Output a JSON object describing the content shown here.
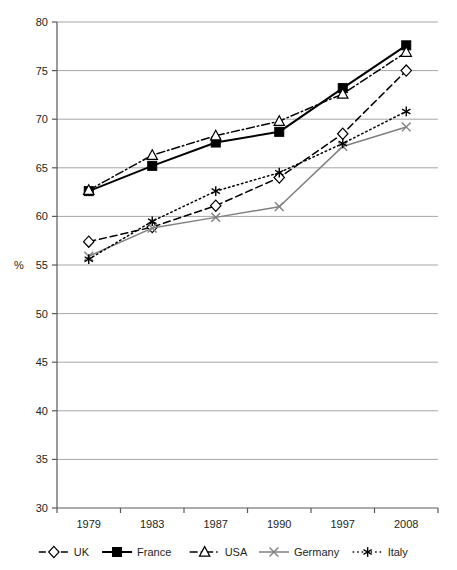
{
  "chart_data": {
    "type": "line",
    "title": "",
    "xlabel": "",
    "ylabel": "%",
    "categories": [
      "1979",
      "1983",
      "1987",
      "1990",
      "1997",
      "2008"
    ],
    "ylim": [
      30,
      80
    ],
    "ytick_step": 5,
    "yticks": [
      "30",
      "35",
      "40",
      "45",
      "50",
      "55",
      "60",
      "65",
      "70",
      "75",
      "80"
    ],
    "grid": "horizontal",
    "legend_position": "bottom",
    "series": [
      {
        "name": "UK",
        "values": [
          57.4,
          58.9,
          61.1,
          64.0,
          68.5,
          75.0
        ],
        "color": "#000000",
        "marker": "diamond-open",
        "dash": "dashed"
      },
      {
        "name": "France",
        "values": [
          62.6,
          65.2,
          67.6,
          68.7,
          73.2,
          77.6
        ],
        "color": "#000000",
        "marker": "square-filled",
        "dash": "solid"
      },
      {
        "name": "USA",
        "values": [
          62.7,
          66.3,
          68.3,
          69.8,
          72.6,
          76.9
        ],
        "color": "#000000",
        "marker": "triangle-open",
        "dash": "dash-dot"
      },
      {
        "name": "Germany",
        "values": [
          55.9,
          58.8,
          59.9,
          61.0,
          67.2,
          69.2
        ],
        "color": "#808080",
        "marker": "cross-x",
        "dash": "solid"
      },
      {
        "name": "Italy",
        "values": [
          55.6,
          59.5,
          62.6,
          64.5,
          67.5,
          70.8
        ],
        "color": "#000000",
        "marker": "asterisk",
        "dash": "dotted"
      }
    ]
  },
  "axis": {
    "unit_label": "%"
  },
  "legend": {
    "items": [
      {
        "label": "UK"
      },
      {
        "label": "France"
      },
      {
        "label": "USA"
      },
      {
        "label": "Germany"
      },
      {
        "label": "Italy"
      }
    ]
  },
  "colors": {
    "gridline": "#a6a6a6",
    "axis": "#595959",
    "series_black": "#000000",
    "series_gray": "#808080",
    "background": "#ffffff"
  }
}
